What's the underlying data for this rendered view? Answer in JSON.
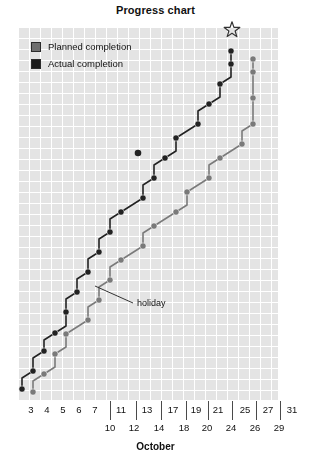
{
  "chart_data": {
    "type": "line",
    "title": "Progress chart",
    "xlabel": "October",
    "ylabel": "",
    "grid": true,
    "legend_position": "top-left",
    "legend": [
      {
        "name": "Planned completion",
        "color": "#6f6f6f",
        "marker": "square"
      },
      {
        "name": "Actual completion",
        "color": "#1a1a1a",
        "marker": "square"
      }
    ],
    "x_ticks_top": [
      "3",
      "4",
      "5",
      "6",
      "7",
      "11",
      "13",
      "17",
      "19",
      "21",
      "25",
      "27",
      "31"
    ],
    "x_ticks_bottom": [
      "10",
      "12",
      "14",
      "18",
      "20",
      "24",
      "26",
      "29"
    ],
    "annotations": [
      {
        "text": "holiday",
        "target_x": 95,
        "target_y": 286
      },
      {
        "text": "star-milestone",
        "symbol": "☆"
      }
    ],
    "series": [
      {
        "name": "Actual completion",
        "color": "#222222",
        "points": [
          [
            22,
            389
          ],
          [
            22,
            378
          ],
          [
            33,
            371
          ],
          [
            33,
            358
          ],
          [
            44,
            351
          ],
          [
            44,
            340
          ],
          [
            55,
            333
          ],
          [
            66,
            326
          ],
          [
            66,
            312
          ],
          [
            66,
            299
          ],
          [
            77,
            292
          ],
          [
            77,
            279
          ],
          [
            88,
            272
          ],
          [
            88,
            259
          ],
          [
            99,
            252
          ],
          [
            99,
            239
          ],
          [
            110,
            232
          ],
          [
            110,
            219
          ],
          [
            121,
            212
          ],
          [
            132,
            205
          ],
          [
            143,
            198
          ],
          [
            143,
            185
          ],
          [
            154,
            178
          ],
          [
            154,
            165
          ],
          [
            165,
            158
          ],
          [
            176,
            151
          ],
          [
            176,
            138
          ],
          [
            187,
            131
          ],
          [
            198,
            124
          ],
          [
            198,
            111
          ],
          [
            209,
            104
          ],
          [
            220,
            97
          ],
          [
            220,
            84
          ],
          [
            231,
            77
          ],
          [
            231,
            64
          ],
          [
            231,
            51
          ]
        ]
      },
      {
        "name": "Planned completion",
        "color": "#7a7a7a",
        "points": [
          [
            33,
            392
          ],
          [
            33,
            381
          ],
          [
            44,
            374
          ],
          [
            55,
            367
          ],
          [
            55,
            354
          ],
          [
            66,
            347
          ],
          [
            66,
            334
          ],
          [
            77,
            327
          ],
          [
            88,
            320
          ],
          [
            88,
            307
          ],
          [
            99,
            300
          ],
          [
            99,
            287
          ],
          [
            110,
            280
          ],
          [
            110,
            267
          ],
          [
            121,
            260
          ],
          [
            132,
            253
          ],
          [
            143,
            246
          ],
          [
            143,
            233
          ],
          [
            154,
            226
          ],
          [
            165,
            219
          ],
          [
            176,
            212
          ],
          [
            187,
            205
          ],
          [
            187,
            192
          ],
          [
            198,
            185
          ],
          [
            209,
            178
          ],
          [
            209,
            165
          ],
          [
            220,
            158
          ],
          [
            231,
            151
          ],
          [
            242,
            144
          ],
          [
            242,
            131
          ],
          [
            253,
            124
          ],
          [
            253,
            111
          ],
          [
            253,
            98
          ],
          [
            253,
            85
          ],
          [
            253,
            72
          ],
          [
            253,
            59
          ]
        ]
      }
    ],
    "isolated_points": [
      {
        "x": 138,
        "y": 153,
        "color": "#222222",
        "series": "Actual completion"
      }
    ]
  }
}
